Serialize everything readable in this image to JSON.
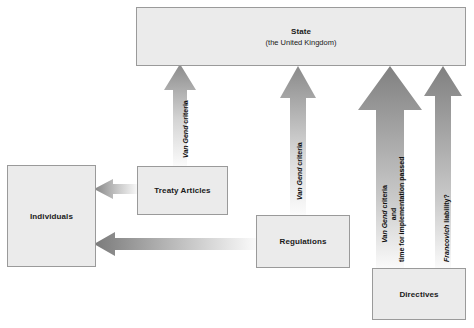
{
  "diagram": {
    "type": "flow-diagram",
    "background_color": "#ffffff",
    "node_fill_color": "#ebebeb",
    "node_border_color": "#9a9a9a",
    "arrow_dark_color": "#7a7a7a",
    "arrow_light_color": "#f2f2f2",
    "nodes": [
      {
        "id": "state",
        "label": "State",
        "sublabel": "(the United Kingdom)"
      },
      {
        "id": "individuals",
        "label": "Individuals",
        "sublabel": ""
      },
      {
        "id": "treaty_articles",
        "label": "Treaty Articles",
        "sublabel": ""
      },
      {
        "id": "regulations",
        "label": "Regulations",
        "sublabel": ""
      },
      {
        "id": "directives",
        "label": "Directives",
        "sublabel": ""
      }
    ],
    "arrows": [
      {
        "id": "arrow-treaty-to-state",
        "from": "treaty_articles",
        "to": "state",
        "direction": "up",
        "label_lines": [
          {
            "italic": "Van Gend",
            "plain": " criteria"
          }
        ]
      },
      {
        "id": "arrow-regulations-to-state",
        "from": "regulations",
        "to": "state",
        "direction": "up",
        "label_lines": [
          {
            "italic": "Van Gend",
            "plain": " criteria"
          }
        ]
      },
      {
        "id": "arrow-directives-to-state-vertical-effect",
        "from": "directives",
        "to": "state",
        "direction": "up",
        "label_lines": [
          {
            "italic": "Van Gend",
            "plain": " criteria"
          },
          {
            "italic": "",
            "plain": "and"
          },
          {
            "italic": "",
            "plain": "time for implementation passed"
          }
        ]
      },
      {
        "id": "arrow-directives-to-state-francovich",
        "from": "directives",
        "to": "state",
        "direction": "up",
        "label_lines": [
          {
            "italic": "Francovich",
            "plain": " liability?"
          }
        ]
      },
      {
        "id": "arrow-treaty-to-individuals",
        "from": "treaty_articles",
        "to": "individuals",
        "direction": "left",
        "label_lines": []
      },
      {
        "id": "arrow-regulations-to-individuals",
        "from": "regulations",
        "to": "individuals",
        "direction": "left",
        "label_lines": []
      }
    ]
  }
}
